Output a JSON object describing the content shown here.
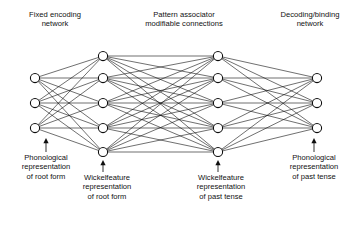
{
  "figure": {
    "type": "neural-network-diagram",
    "width": 362,
    "height": 226,
    "background_color": "#ffffff",
    "ink_color": "#0f0f0f"
  },
  "top_labels": {
    "fixed_encoding": "Fixed encoding\nnetwork",
    "pattern_associator": "Pattern associator\nmodifiable connections",
    "decoding_binding": "Decoding/binding\nnetwork"
  },
  "bottom_labels": {
    "phonological_root": "Phonological\nrepresentation\nof root form",
    "wickelfeature_root": "Wickelfeature\nrepresentation\nof root form",
    "wickelfeature_past": "Wickelfeature\nrepresentation\nof past tense",
    "phonological_past": "Phonological\nrepresentation\nof past tense"
  },
  "network": {
    "layers": [
      {
        "name": "phonological-root-layer",
        "x": 35,
        "node_count": 3,
        "node_y": [
          78,
          103,
          128
        ],
        "node_radius": 4.6
      },
      {
        "name": "wickelfeature-root-layer",
        "x": 103,
        "node_count": 5,
        "node_y": [
          56,
          78,
          103,
          128,
          152
        ],
        "node_radius": 4.6
      },
      {
        "name": "wickelfeature-past-layer",
        "x": 218,
        "node_count": 5,
        "node_y": [
          56,
          78,
          103,
          128,
          152
        ],
        "node_radius": 4.6
      },
      {
        "name": "phonological-past-layer",
        "x": 317,
        "node_count": 3,
        "node_y": [
          78,
          103,
          128
        ],
        "node_radius": 4.6
      }
    ],
    "connections": [
      {
        "from": 0,
        "to": 1,
        "style": "full-bipartite",
        "label": "fixed encoding network"
      },
      {
        "from": 1,
        "to": 2,
        "style": "full-bipartite",
        "label": "pattern associator modifiable connections"
      },
      {
        "from": 2,
        "to": 3,
        "style": "full-bipartite",
        "label": "decoding/binding network"
      }
    ]
  },
  "pointers": [
    {
      "name": "pointer-phonological-root",
      "x": 46,
      "from_y": 152,
      "to_y": 138,
      "head": true
    },
    {
      "name": "pointer-wickelfeature-root",
      "x": 103,
      "from_y": 172,
      "to_y": 160,
      "head": true
    },
    {
      "name": "pointer-wickelfeature-past",
      "x": 218,
      "from_y": 172,
      "to_y": 160,
      "head": true
    },
    {
      "name": "pointer-phonological-past",
      "x": 314,
      "from_y": 152,
      "to_y": 138,
      "head": true
    }
  ]
}
